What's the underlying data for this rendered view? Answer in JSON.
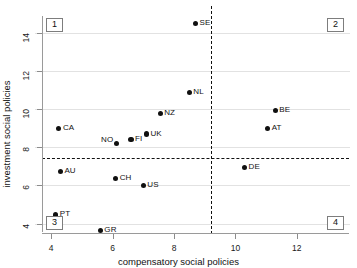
{
  "chart_data": {
    "type": "scatter",
    "title": "",
    "xlabel": "compensatory social policies",
    "ylabel": "investment social policies",
    "xlim": [
      3.7,
      13.7
    ],
    "ylim": [
      3.45,
      14.9
    ],
    "xticks": [
      4,
      6,
      8,
      10,
      12
    ],
    "yticks": [
      4,
      6,
      8,
      10,
      12,
      14
    ],
    "xtick_labels": [
      "4",
      "6",
      "8",
      "10",
      "12"
    ],
    "ytick_labels": [
      "4",
      "6",
      "8",
      "10",
      "12",
      "14"
    ],
    "grid": "horizontal",
    "legend": "none",
    "reference_lines": {
      "vertical_x": 9.2,
      "horizontal_y": 7.45,
      "style": "dashed"
    },
    "quadrant_labels": [
      {
        "id": "1",
        "position": "top-left"
      },
      {
        "id": "2",
        "position": "top-right"
      },
      {
        "id": "3",
        "position": "bottom-left"
      },
      {
        "id": "4",
        "position": "bottom-right"
      }
    ],
    "points": [
      {
        "label": "SE",
        "x": 8.7,
        "y": 14.5,
        "label_pos": "right"
      },
      {
        "label": "NL",
        "x": 8.5,
        "y": 10.9,
        "label_pos": "right"
      },
      {
        "label": "BE",
        "x": 11.3,
        "y": 9.95,
        "label_pos": "right"
      },
      {
        "label": "NZ",
        "x": 7.55,
        "y": 9.8,
        "label_pos": "right"
      },
      {
        "label": "AT",
        "x": 11.05,
        "y": 9.0,
        "label_pos": "right"
      },
      {
        "label": "CA",
        "x": 4.25,
        "y": 9.0,
        "label_pos": "right"
      },
      {
        "label": "UK",
        "x": 7.1,
        "y": 8.7,
        "label_pos": "right"
      },
      {
        "label": "FI",
        "x": 6.6,
        "y": 8.4,
        "label_pos": "right"
      },
      {
        "label": "NO",
        "x": 6.12,
        "y": 8.2,
        "label_pos": "upleft"
      },
      {
        "label": "DE",
        "x": 10.3,
        "y": 6.95,
        "label_pos": "right"
      },
      {
        "label": "AU",
        "x": 4.3,
        "y": 6.75,
        "label_pos": "right"
      },
      {
        "label": "CH",
        "x": 6.1,
        "y": 6.35,
        "label_pos": "right"
      },
      {
        "label": "US",
        "x": 7.0,
        "y": 6.0,
        "label_pos": "right"
      },
      {
        "label": "PT",
        "x": 4.15,
        "y": 4.45,
        "label_pos": "right"
      },
      {
        "label": "GR",
        "x": 5.6,
        "y": 3.65,
        "label_pos": "right"
      }
    ]
  }
}
